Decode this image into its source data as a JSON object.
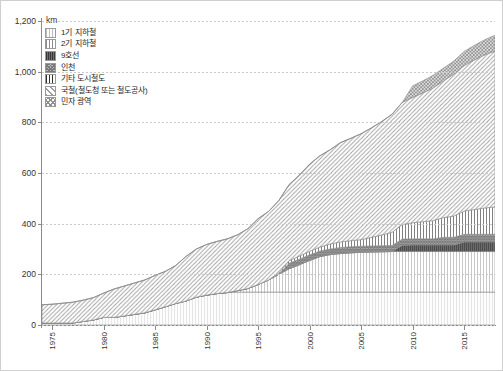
{
  "unit_label": "km",
  "legend": {
    "position": "top-left-inside",
    "items": [
      {
        "key": "subway1",
        "label": "1기 지하철",
        "pattern": "p-g1"
      },
      {
        "key": "subway2",
        "label": "2기 지하철",
        "pattern": "p-g2"
      },
      {
        "key": "line9",
        "label": "9호선",
        "pattern": "p-l9"
      },
      {
        "key": "incheon",
        "label": "인천",
        "pattern": "p-ic"
      },
      {
        "key": "other",
        "label": "기타 도시철도",
        "pattern": "p-ot"
      },
      {
        "key": "national",
        "label": "국철(철도청 또는 철도공사)",
        "pattern": "p-kr"
      },
      {
        "key": "private",
        "label": "민자 광역",
        "pattern": "p-pv"
      }
    ]
  },
  "chart_data": {
    "type": "area",
    "title": "",
    "xlabel": "",
    "ylabel": "km",
    "ylim": [
      0,
      1200
    ],
    "yticks": [
      0,
      200,
      400,
      600,
      800,
      1000,
      1200
    ],
    "ytick_labels": [
      "0",
      "200",
      "400",
      "600",
      "800",
      "1,000",
      "1,200"
    ],
    "xlim": [
      1974,
      2018
    ],
    "xticks": [
      1975,
      1980,
      1985,
      1990,
      1995,
      2000,
      2005,
      2010,
      2015
    ],
    "xtick_labels": [
      "1975",
      "1980",
      "1985",
      "1990",
      "1995",
      "2000",
      "2005",
      "2010",
      "2015"
    ],
    "grid": "horizontal-dotted",
    "stacked": true,
    "x": [
      1974,
      1975,
      1976,
      1977,
      1978,
      1979,
      1980,
      1981,
      1982,
      1983,
      1984,
      1985,
      1986,
      1987,
      1988,
      1989,
      1990,
      1991,
      1992,
      1993,
      1994,
      1995,
      1996,
      1997,
      1998,
      1999,
      2000,
      2001,
      2002,
      2003,
      2004,
      2005,
      2006,
      2007,
      2008,
      2009,
      2010,
      2011,
      2012,
      2013,
      2014,
      2015,
      2016,
      2017,
      2018
    ],
    "series": [
      {
        "name": "1기 지하철",
        "key": "subway1",
        "pattern": "p-g1",
        "values": [
          8,
          8,
          8,
          8,
          14,
          20,
          30,
          30,
          36,
          42,
          48,
          60,
          72,
          85,
          95,
          110,
          118,
          124,
          128,
          130,
          130,
          130,
          130,
          130,
          130,
          130,
          130,
          130,
          130,
          130,
          130,
          130,
          130,
          130,
          130,
          130,
          130,
          130,
          130,
          130,
          130,
          130,
          130,
          130,
          130
        ]
      },
      {
        "name": "2기 지하철",
        "key": "subway2",
        "pattern": "p-g2",
        "values": [
          0,
          0,
          0,
          0,
          0,
          0,
          0,
          0,
          0,
          0,
          0,
          0,
          0,
          0,
          0,
          0,
          0,
          0,
          0,
          6,
          14,
          30,
          48,
          70,
          92,
          108,
          125,
          140,
          148,
          152,
          155,
          157,
          158,
          159,
          160,
          160,
          160,
          160,
          160,
          160,
          160,
          160,
          160,
          160,
          160
        ]
      },
      {
        "name": "9호선",
        "key": "line9",
        "pattern": "p-l9",
        "values": [
          0,
          0,
          0,
          0,
          0,
          0,
          0,
          0,
          0,
          0,
          0,
          0,
          0,
          0,
          0,
          0,
          0,
          0,
          0,
          0,
          0,
          0,
          0,
          0,
          0,
          0,
          0,
          0,
          0,
          0,
          0,
          0,
          0,
          0,
          0,
          25,
          26,
          26,
          26,
          26,
          26,
          38,
          38,
          38,
          38
        ]
      },
      {
        "name": "인천",
        "key": "incheon",
        "pattern": "p-ic",
        "values": [
          0,
          0,
          0,
          0,
          0,
          0,
          0,
          0,
          0,
          0,
          0,
          0,
          0,
          0,
          0,
          0,
          0,
          0,
          0,
          0,
          0,
          0,
          0,
          0,
          22,
          22,
          22,
          22,
          22,
          24,
          24,
          24,
          24,
          24,
          24,
          24,
          24,
          24,
          24,
          30,
          30,
          30,
          30,
          30,
          30
        ]
      },
      {
        "name": "기타 도시철도",
        "key": "other",
        "pattern": "p-ot",
        "values": [
          0,
          0,
          0,
          0,
          0,
          0,
          0,
          0,
          0,
          0,
          0,
          0,
          0,
          0,
          0,
          0,
          0,
          0,
          0,
          0,
          0,
          0,
          0,
          5,
          10,
          12,
          14,
          16,
          20,
          22,
          24,
          26,
          34,
          42,
          52,
          58,
          64,
          68,
          72,
          78,
          84,
          92,
          98,
          104,
          108
        ]
      },
      {
        "name": "국철(철도청 또는 철도공사)",
        "key": "national",
        "pattern": "p-kr",
        "values": [
          72,
          74,
          78,
          82,
          84,
          88,
          96,
          112,
          118,
          124,
          130,
          136,
          140,
          150,
          176,
          190,
          200,
          206,
          212,
          220,
          236,
          260,
          270,
          286,
          300,
          320,
          344,
          360,
          372,
          392,
          404,
          418,
          432,
          448,
          466,
          482,
          494,
          508,
          524,
          540,
          560,
          574,
          590,
          604,
          616
        ]
      },
      {
        "name": "민자 광역",
        "key": "private",
        "pattern": "p-pv",
        "values": [
          0,
          0,
          0,
          0,
          0,
          0,
          0,
          0,
          0,
          0,
          0,
          0,
          0,
          0,
          0,
          0,
          0,
          0,
          0,
          0,
          0,
          0,
          0,
          0,
          0,
          0,
          0,
          0,
          0,
          0,
          0,
          0,
          0,
          0,
          0,
          0,
          46,
          48,
          50,
          50,
          52,
          56,
          58,
          60,
          62
        ]
      }
    ]
  }
}
